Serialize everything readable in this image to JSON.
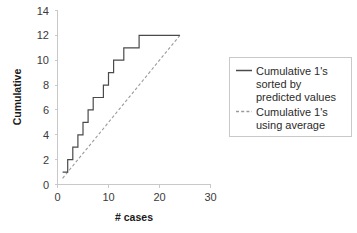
{
  "chart_data": {
    "type": "line",
    "title": "",
    "xlabel": "# cases",
    "ylabel": "Cumulative",
    "xlim": [
      0,
      30
    ],
    "ylim": [
      0,
      14
    ],
    "xticks": [
      0,
      10,
      20,
      30
    ],
    "yticks": [
      0,
      2,
      4,
      6,
      8,
      10,
      12,
      14
    ],
    "grid": false,
    "legend_position": "right",
    "series": [
      {
        "name": "Cumulative 1's sorted by predicted values",
        "style": "solid",
        "color": "#4a4a4a",
        "x": [
          1,
          2,
          3,
          4,
          5,
          6,
          7,
          8,
          9,
          10,
          11,
          12,
          13,
          14,
          15,
          16,
          17,
          18,
          19,
          20,
          21,
          22,
          23,
          24
        ],
        "y": [
          1,
          2,
          3,
          4,
          5,
          6,
          7,
          7,
          8,
          9,
          10,
          10,
          11,
          11,
          11,
          12,
          12,
          12,
          12,
          12,
          12,
          12,
          12,
          12
        ]
      },
      {
        "name": "Cumulative 1's using average",
        "style": "dashed",
        "color": "#9a9a9a",
        "x": [
          1,
          24
        ],
        "y": [
          0.5,
          12
        ]
      }
    ]
  },
  "axes": {
    "y_tick_labels": [
      "14",
      "12",
      "10",
      "8",
      "6",
      "4",
      "2",
      "0"
    ],
    "x_tick_labels": [
      "0",
      "10",
      "20",
      "30"
    ],
    "y_axis_title": "Cumulative",
    "x_axis_title": "# cases"
  },
  "legend": {
    "entries": [
      {
        "label_line1": "Cumulative 1's",
        "label_line2": "sorted by",
        "label_line3": "predicted values",
        "marker": "solid-line-swatch"
      },
      {
        "label_line1": "Cumulative 1's",
        "label_line2": "using average",
        "label_line3": "",
        "marker": "dashed-line-swatch"
      }
    ]
  },
  "colors": {
    "series_solid": "#4a4a4a",
    "series_dashed": "#9a9a9a",
    "axis": "#c9c9c9",
    "text": "#2b2b2b",
    "background": "#ffffff"
  }
}
